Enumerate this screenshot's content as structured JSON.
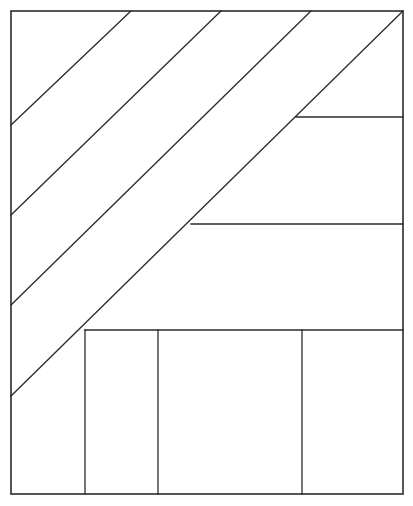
{
  "canvas": {
    "width": 413,
    "height": 506,
    "background": "#ffffff",
    "stroke_color": "#2b2b2b",
    "figure_title": "Geometric partition diagram",
    "description": "Rectangle divided by four parallel diagonal lines and several horizontal and vertical segments"
  },
  "outer_frame": {
    "name": "outer rectangle",
    "x": 11,
    "y": 11,
    "width": 392,
    "height": 483,
    "stroke_width": 1.6
  },
  "diagonals": {
    "count": 4,
    "direction": "lower-left to upper-right",
    "slope": -1,
    "lines": [
      {
        "label": "diagonal-1",
        "x1": 11,
        "y1": 125,
        "x2": 131,
        "y2": 11
      },
      {
        "label": "diagonal-2",
        "x1": 11,
        "y1": 215,
        "x2": 221,
        "y2": 11
      },
      {
        "label": "diagonal-3",
        "x1": 11,
        "y1": 305,
        "x2": 311,
        "y2": 11
      },
      {
        "label": "diagonal-4",
        "x1": 11,
        "y1": 396,
        "x2": 403,
        "y2": 11
      }
    ]
  },
  "horizontals": {
    "count": 3,
    "lines": [
      {
        "label": "horizontal-upper-right",
        "x1": 296,
        "y1": 117,
        "x2": 403,
        "y2": 117
      },
      {
        "label": "horizontal-middle-right",
        "x1": 191,
        "y1": 224,
        "x2": 403,
        "y2": 224
      },
      {
        "label": "horizontal-bottom-band",
        "x1": 85,
        "y1": 330,
        "x2": 403,
        "y2": 330
      }
    ]
  },
  "verticals": {
    "count": 3,
    "lines": [
      {
        "label": "vertical-left-cell",
        "x1": 85,
        "y1": 330,
        "x2": 85,
        "y2": 494
      },
      {
        "label": "vertical-mid-cell",
        "x1": 158,
        "y1": 330,
        "x2": 158,
        "y2": 494
      },
      {
        "label": "vertical-right-cell",
        "x1": 302,
        "y1": 330,
        "x2": 302,
        "y2": 494
      }
    ]
  },
  "regions": {
    "total": 10,
    "names": [
      "upper-left-triangle",
      "diagonal-band-1",
      "diagonal-band-2",
      "diagonal-band-3",
      "upper-right-strip",
      "middle-right-panel",
      "lower-left-wedge",
      "bottom-cell-1",
      "bottom-cell-2",
      "bottom-cell-3"
    ]
  }
}
